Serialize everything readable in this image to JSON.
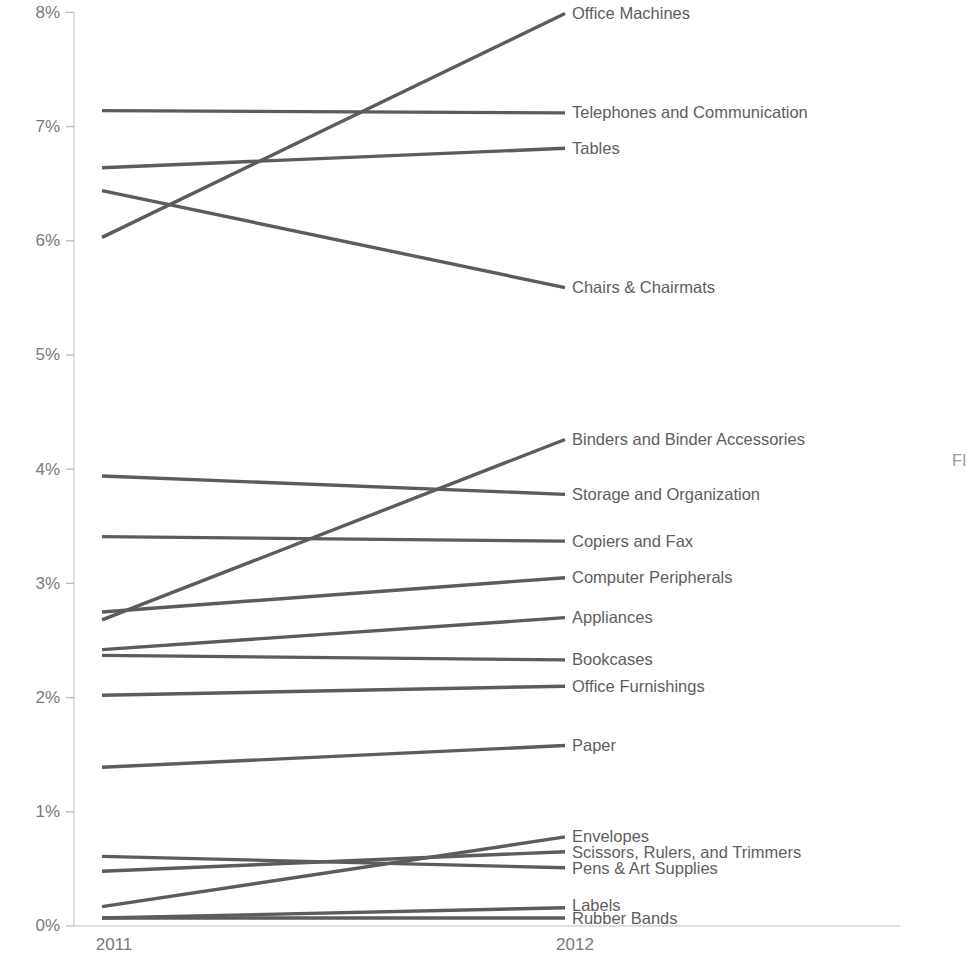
{
  "chart_data": {
    "type": "line",
    "subtype": "slope-chart",
    "title": "",
    "xlabel": "",
    "ylabel": "",
    "x": [
      "2011",
      "2012"
    ],
    "categories": [
      "2011",
      "2012"
    ],
    "ylim": [
      0,
      8
    ],
    "ytick_values": [
      0,
      1,
      2,
      3,
      4,
      5,
      6,
      7,
      8
    ],
    "ytick_labels": [
      "0%",
      "1%",
      "2%",
      "3%",
      "4%",
      "5%",
      "6%",
      "7%",
      "8%"
    ],
    "xtick_labels": [
      "2011",
      "2012"
    ],
    "grid": false,
    "legend": "right-inline-labels",
    "value_unit": "percent",
    "line_color": "#5c5c5c",
    "text_color": "#5e5e5e",
    "axis_color": "#d4d4d4",
    "series": [
      {
        "name": "Office Machines",
        "values": [
          6.03,
          7.99
        ]
      },
      {
        "name": "Telephones and Communication",
        "values": [
          7.14,
          7.12
        ]
      },
      {
        "name": "Tables",
        "values": [
          6.64,
          6.81
        ]
      },
      {
        "name": "Chairs & Chairmats",
        "values": [
          6.44,
          5.59
        ]
      },
      {
        "name": "Binders and Binder Accessories",
        "values": [
          2.68,
          4.26
        ]
      },
      {
        "name": "Storage and Organization",
        "values": [
          3.94,
          3.78
        ]
      },
      {
        "name": "Copiers and Fax",
        "values": [
          3.41,
          3.37
        ]
      },
      {
        "name": "Computer Peripherals",
        "values": [
          2.75,
          3.05
        ]
      },
      {
        "name": "Appliances",
        "values": [
          2.42,
          2.7
        ]
      },
      {
        "name": "Bookcases",
        "values": [
          2.37,
          2.33
        ]
      },
      {
        "name": "Office Furnishings",
        "values": [
          2.02,
          2.1
        ]
      },
      {
        "name": "Paper",
        "values": [
          1.39,
          1.58
        ]
      },
      {
        "name": "Envelopes",
        "values": [
          0.17,
          0.78
        ]
      },
      {
        "name": "Scissors, Rulers, and Trimmers",
        "values": [
          0.48,
          0.65
        ]
      },
      {
        "name": "Pens & Art Supplies",
        "values": [
          0.61,
          0.51
        ]
      },
      {
        "name": "Labels",
        "values": [
          0.07,
          0.16
        ]
      },
      {
        "name": "Rubber Bands",
        "values": [
          0.07,
          0.07
        ]
      }
    ],
    "label_overrides": {
      "Scissors, Rulers, and Trimmers": 0.645,
      "Pens & Art Supplies": 0.5,
      "Labels": 0.175,
      "Rubber Bands": 0.065
    }
  },
  "corner_text": "FI"
}
